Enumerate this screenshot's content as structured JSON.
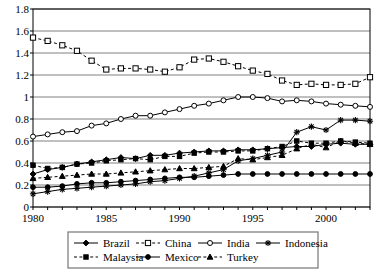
{
  "chart_data": {
    "type": "line",
    "title": "",
    "subtitle": "",
    "xlabel": "",
    "ylabel": "",
    "xlim": [
      1980,
      2003
    ],
    "ylim": [
      0,
      1.8
    ],
    "grid": true,
    "grid_axis": "y",
    "legend_position": "bottom",
    "legend_columns": 4,
    "x": [
      1980,
      1981,
      1982,
      1983,
      1984,
      1985,
      1986,
      1987,
      1988,
      1989,
      1990,
      1991,
      1992,
      1993,
      1994,
      1995,
      1996,
      1997,
      1998,
      1999,
      2000,
      2001,
      2002,
      2003
    ],
    "ytick_labels": [
      "0",
      "0.2",
      "0.4",
      "0.6",
      "0.8",
      "1",
      "1.2",
      "1.4",
      "1.6",
      "1.8"
    ],
    "ytick_values": [
      0,
      0.2,
      0.4,
      0.6,
      0.8,
      1.0,
      1.2,
      1.4,
      1.6,
      1.8
    ],
    "xtick_labels": [
      "1980",
      "1985",
      "1990",
      "1995",
      "2000"
    ],
    "xtick_values": [
      1980,
      1985,
      1990,
      1995,
      2000
    ],
    "series": [
      {
        "name": "Brazil",
        "marker": "diamond",
        "dash": "solid",
        "values": [
          0.3,
          0.34,
          0.36,
          0.39,
          0.41,
          0.43,
          0.45,
          0.44,
          0.47,
          0.47,
          0.49,
          0.5,
          0.51,
          0.51,
          0.52,
          0.52,
          0.53,
          0.54,
          0.55,
          0.55,
          0.57,
          0.58,
          0.57,
          0.57
        ]
      },
      {
        "name": "China",
        "marker": "square-open",
        "dash": "dashed",
        "values": [
          1.54,
          1.51,
          1.47,
          1.42,
          1.33,
          1.25,
          1.26,
          1.26,
          1.25,
          1.23,
          1.27,
          1.34,
          1.35,
          1.32,
          1.28,
          1.24,
          1.21,
          1.15,
          1.11,
          1.12,
          1.11,
          1.11,
          1.12,
          1.18
        ]
      },
      {
        "name": "India",
        "marker": "circle-open",
        "dash": "solid",
        "values": [
          0.64,
          0.66,
          0.68,
          0.69,
          0.74,
          0.76,
          0.8,
          0.83,
          0.83,
          0.86,
          0.89,
          0.92,
          0.94,
          0.97,
          1.0,
          1.0,
          0.99,
          0.96,
          0.97,
          0.96,
          0.94,
          0.93,
          0.92,
          0.91
        ]
      },
      {
        "name": "Indonesia",
        "marker": "star",
        "dash": "solid",
        "values": [
          0.12,
          0.14,
          0.16,
          0.17,
          0.18,
          0.19,
          0.2,
          0.21,
          0.23,
          0.24,
          0.26,
          0.28,
          0.31,
          0.34,
          0.42,
          0.44,
          0.47,
          0.5,
          0.68,
          0.73,
          0.7,
          0.79,
          0.79,
          0.78
        ]
      },
      {
        "name": "Malaysia",
        "marker": "square-filled",
        "dash": "dashed",
        "values": [
          0.38,
          0.35,
          0.36,
          0.39,
          0.4,
          0.42,
          0.43,
          0.44,
          0.43,
          0.46,
          0.46,
          0.49,
          0.5,
          0.5,
          0.51,
          0.51,
          0.53,
          0.55,
          0.6,
          0.58,
          0.58,
          0.6,
          0.59,
          0.58
        ]
      },
      {
        "name": "Mexico",
        "marker": "circle-filled",
        "dash": "solid",
        "values": [
          0.18,
          0.18,
          0.19,
          0.21,
          0.22,
          0.22,
          0.23,
          0.24,
          0.25,
          0.26,
          0.27,
          0.27,
          0.28,
          0.29,
          0.3,
          0.3,
          0.3,
          0.3,
          0.3,
          0.3,
          0.3,
          0.3,
          0.3,
          0.3
        ]
      },
      {
        "name": "Turkey",
        "marker": "triangle",
        "dash": "dashed",
        "values": [
          0.26,
          0.27,
          0.28,
          0.29,
          0.3,
          0.3,
          0.31,
          0.32,
          0.33,
          0.34,
          0.35,
          0.35,
          0.36,
          0.37,
          0.44,
          0.43,
          0.45,
          0.47,
          0.53,
          0.57,
          0.54,
          0.6,
          0.58,
          0.57
        ]
      }
    ]
  },
  "legend": {
    "entries": [
      {
        "label": "Brazil"
      },
      {
        "label": "China"
      },
      {
        "label": "India"
      },
      {
        "label": "Indonesia"
      },
      {
        "label": "Malaysia"
      },
      {
        "label": "Mexico"
      },
      {
        "label": "Turkey"
      }
    ]
  },
  "colors": {
    "series": "#000000",
    "grid": "#808080",
    "axis": "#000000",
    "plot_background": "#ffffff"
  }
}
